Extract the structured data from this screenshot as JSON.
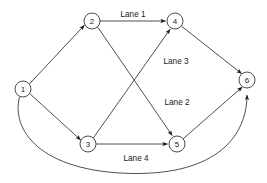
{
  "diagram": {
    "canvas": {
      "width": 267,
      "height": 183,
      "background": "#ffffff"
    },
    "style": {
      "stroke_color": "#3a3a3a",
      "node_fill": "#ffffff",
      "text_color": "#1a1a1a"
    },
    "nodes": [
      {
        "id": "1",
        "label": "1",
        "cx": 23,
        "cy": 89,
        "r": 8
      },
      {
        "id": "2",
        "label": "2",
        "cx": 92,
        "cy": 21,
        "r": 8
      },
      {
        "id": "3",
        "label": "3",
        "cx": 88,
        "cy": 144,
        "r": 8
      },
      {
        "id": "4",
        "label": "4",
        "cx": 175,
        "cy": 21,
        "r": 8
      },
      {
        "id": "5",
        "label": "5",
        "cx": 177,
        "cy": 144,
        "r": 8
      },
      {
        "id": "6",
        "label": "6",
        "cx": 247,
        "cy": 80,
        "r": 8
      }
    ],
    "edges": [
      {
        "from": "1",
        "to": "2",
        "label": "",
        "shape": "straight"
      },
      {
        "from": "1",
        "to": "3",
        "label": "",
        "shape": "straight"
      },
      {
        "from": "2",
        "to": "4",
        "label": "Lane 1",
        "shape": "straight"
      },
      {
        "from": "2",
        "to": "5",
        "label": "Lane 2",
        "shape": "straight"
      },
      {
        "from": "3",
        "to": "4",
        "label": "Lane 3",
        "shape": "straight"
      },
      {
        "from": "3",
        "to": "5",
        "label": "Lane 4",
        "shape": "straight"
      },
      {
        "from": "4",
        "to": "6",
        "label": "",
        "shape": "straight"
      },
      {
        "from": "5",
        "to": "6",
        "label": "",
        "shape": "straight"
      },
      {
        "from": "1",
        "to": "6",
        "label": "",
        "shape": "curved-bottom"
      }
    ],
    "lane_labels": [
      {
        "text": "Lane 1",
        "x": 133,
        "y": 14
      },
      {
        "text": "Lane 3",
        "x": 176,
        "y": 61
      },
      {
        "text": "Lane 2",
        "x": 177,
        "y": 102
      },
      {
        "text": "Lane 4",
        "x": 136,
        "y": 158
      }
    ]
  }
}
